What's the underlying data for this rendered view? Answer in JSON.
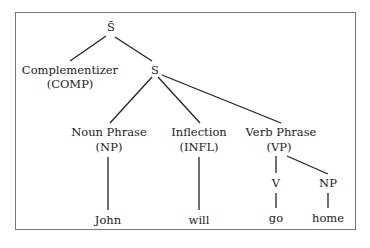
{
  "diagram": {
    "type": "syntax-tree",
    "nodes": {
      "sbar": {
        "label": "S̄"
      },
      "comp": {
        "label": "Complementizer",
        "abbr": "(COMP)"
      },
      "s": {
        "label": "S"
      },
      "np": {
        "label": "Noun Phrase",
        "abbr": "(NP)"
      },
      "infl": {
        "label": "Inflection",
        "abbr": "(INFL)"
      },
      "vp": {
        "label": "Verb Phrase",
        "abbr": "(VP)"
      },
      "v": {
        "label": "V"
      },
      "np2": {
        "label": "NP"
      }
    },
    "leaves": {
      "john": "John",
      "will": "will",
      "go": "go",
      "home": "home"
    },
    "edges": [
      [
        "S̄",
        "Complementizer (COMP)"
      ],
      [
        "S̄",
        "S"
      ],
      [
        "S",
        "Noun Phrase (NP)"
      ],
      [
        "S",
        "Inflection (INFL)"
      ],
      [
        "S",
        "Verb Phrase (VP)"
      ],
      [
        "Noun Phrase (NP)",
        "John"
      ],
      [
        "Inflection (INFL)",
        "will"
      ],
      [
        "Verb Phrase (VP)",
        "V"
      ],
      [
        "Verb Phrase (VP)",
        "NP"
      ],
      [
        "V",
        "go"
      ],
      [
        "NP",
        "home"
      ]
    ],
    "colors": {
      "line": "#222222",
      "frame": "#777777",
      "text": "#222222"
    }
  }
}
